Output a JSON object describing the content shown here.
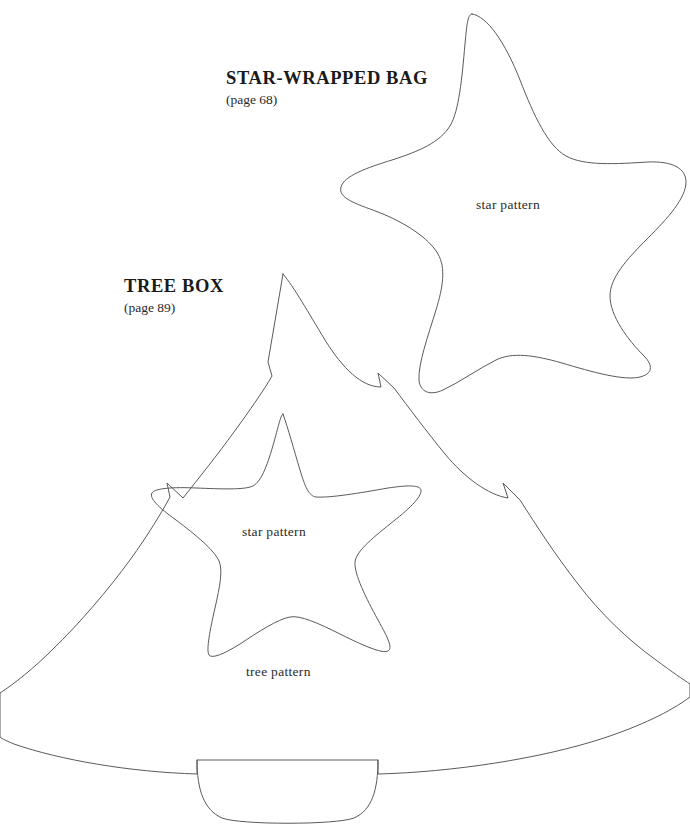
{
  "page": {
    "background_color": "#ffffff",
    "line_color": "#5a5a5a",
    "text_color": "#1a1a1a",
    "width": 690,
    "height": 837
  },
  "patterns": [
    {
      "id": "star-wrapped-bag",
      "title": "STAR-WRAPPED BAG",
      "page_reference": "(page 68)",
      "shape_label": "star pattern",
      "shape": "rounded-five-point-star"
    },
    {
      "id": "tree-box",
      "title": "TREE BOX",
      "page_reference": "(page 89)",
      "shape_label": "tree pattern",
      "inner_shape_label": "star pattern",
      "shape": "christmas-tree-with-trunk"
    }
  ],
  "labels": {
    "big_star": "star pattern",
    "inner_star": "star pattern",
    "tree": "tree pattern"
  }
}
